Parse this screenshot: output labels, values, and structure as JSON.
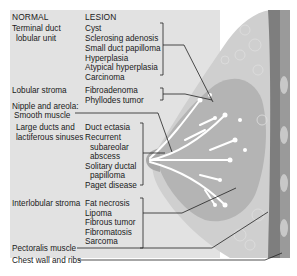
{
  "headers": {
    "normal": "NORMAL",
    "lesion": "LESION"
  },
  "rows": [
    {
      "normal": [
        "Terminal duct",
        " lobular unit"
      ],
      "lesions": [
        "Cyst",
        "Sclerosing adenosis",
        "Small duct papilloma",
        "Hyperplasia",
        "Atypical hyperplasia",
        "Carcinoma"
      ]
    },
    {
      "normal": [
        "Lobular stroma"
      ],
      "lesions": [
        "Fibroadenoma",
        "Phyllodes tumor"
      ]
    },
    {
      "normal": [
        "Nipple and areola:",
        " Smooth muscle"
      ],
      "lesions": []
    },
    {
      "normal": [
        "Large ducts and",
        "lactiferous sinuses"
      ],
      "lesions": [
        "Duct ectasia",
        "Recurrent",
        "  subareolar",
        "  abscess",
        "Solitary ductal",
        "  papilloma",
        "Paget disease"
      ]
    },
    {
      "normal": [
        "Interlobular stroma"
      ],
      "lesions": [
        "Fat necrosis",
        "Lipoma",
        "Fibrous tumor",
        "Fibromatosis",
        "Sarcoma"
      ]
    },
    {
      "normal": [
        "Pectoralis muscle"
      ],
      "lesions": []
    },
    {
      "normal": [
        "Chest wall and ribs"
      ],
      "lesions": []
    }
  ],
  "colors": {
    "panel": "#e2e2e2",
    "tissue": "#b9b9b9",
    "fat": "#cfcfcf",
    "muscle": "#7e7e7e",
    "ducts": "#ffffff",
    "leader": "#222222"
  }
}
